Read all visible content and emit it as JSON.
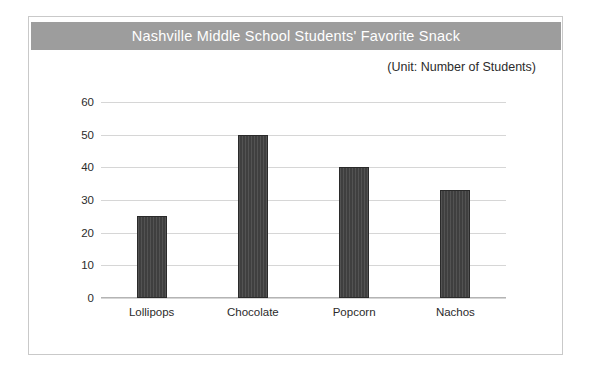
{
  "chart_data": {
    "type": "bar",
    "title": "Nashville Middle School Students' Favorite Snack",
    "subtitle": "(Unit: Number of Students)",
    "categories": [
      "Lollipops",
      "Chocolate",
      "Popcorn",
      "Nachos"
    ],
    "values": [
      25,
      50,
      40,
      33
    ],
    "xlabel": "",
    "ylabel": "",
    "ylim": [
      0,
      60
    ],
    "yticks": [
      0,
      10,
      20,
      30,
      40,
      50,
      60
    ],
    "grid": true,
    "legend": false,
    "bar_color": "#3f3f3f",
    "title_banner_color": "#9d9d9d",
    "title_text_color": "#ffffff",
    "gridline_color": "#d6d6d6",
    "background_color": "#ffffff"
  }
}
